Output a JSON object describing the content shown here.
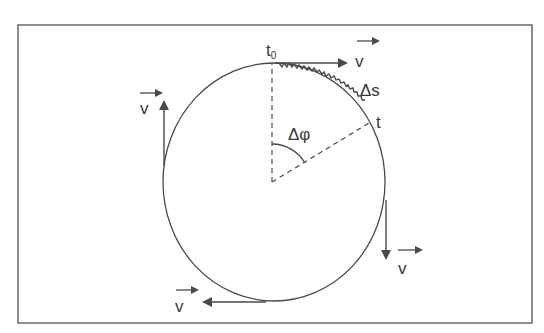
{
  "diagram": {
    "colors": {
      "stroke": "#4a4a4a",
      "frame": "#6a6a6a",
      "background": "#ffffff"
    },
    "labels": {
      "t0_main": "t",
      "t0_sub": "0",
      "t": "t",
      "delta_s": "Δs",
      "delta_phi": "Δφ",
      "v_top": "v",
      "v_left": "v",
      "v_right": "v",
      "v_bottom": "v"
    }
  }
}
